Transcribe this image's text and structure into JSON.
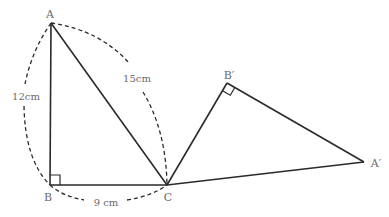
{
  "diagram": {
    "colors": {
      "line": "#2a2a2a",
      "dash": "#2a2a2a",
      "label": "#6a6a6a"
    },
    "points": {
      "A": {
        "label": "A",
        "x": 51,
        "y": 23
      },
      "B": {
        "label": "B",
        "x": 50,
        "y": 185
      },
      "C": {
        "label": "C",
        "x": 167,
        "y": 185
      },
      "B_prime": {
        "label": "B′",
        "x": 227,
        "y": 83
      },
      "A_prime": {
        "label": "A′",
        "x": 364,
        "y": 162
      }
    },
    "measurements": {
      "AB": "12cm",
      "AC": "15cm",
      "BC": "9 cm"
    },
    "right_angles": [
      "B",
      "B′"
    ],
    "triangles": [
      {
        "name": "ABC",
        "vertices": [
          "A",
          "B",
          "C"
        ]
      },
      {
        "name": "A′B′C",
        "vertices": [
          "A′",
          "B′",
          "C"
        ]
      }
    ]
  }
}
